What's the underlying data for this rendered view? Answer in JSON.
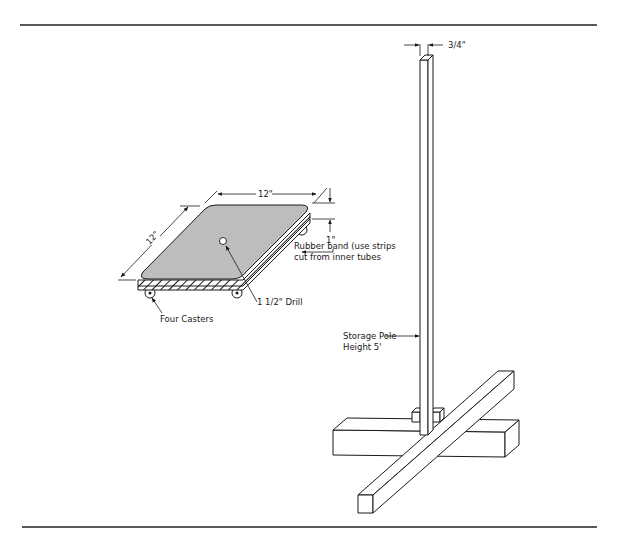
{
  "figure": {
    "type": "technical-illustration",
    "colors": {
      "line": "#1a1a1a",
      "board_fill": "#bdbdbd",
      "background": "#ffffff"
    }
  },
  "dolly": {
    "dimensions": {
      "width_label": "12\"",
      "depth_label": "12\"",
      "thickness_label": "1\""
    },
    "callouts": {
      "rubber_band_line1": "Rubber band (use strips",
      "rubber_band_line2": "cut from inner tubes",
      "drill": "1 1/2\" Drill",
      "casters": "Four Casters"
    }
  },
  "storage_pole": {
    "dimensions": {
      "pole_width_label": "3/4\""
    },
    "callouts": {
      "label_line1": "Storage Pole",
      "label_line2": "Height 5'"
    }
  }
}
